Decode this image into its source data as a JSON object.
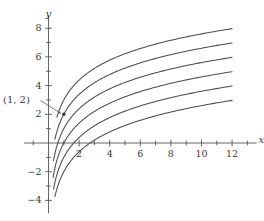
{
  "chart_data": {
    "type": "line",
    "title": "",
    "subtitle": "",
    "xlabel": "x",
    "ylabel": "y",
    "xlim": [
      -1.6,
      13.6
    ],
    "ylim": [
      -4.9,
      8.9
    ],
    "grid": false,
    "legend": null,
    "axis_color": "#55555a",
    "curve_color": "#4a4a52",
    "point_color": "#3a3a3a",
    "x_ticks_major": [
      2,
      4,
      6,
      8,
      10,
      12
    ],
    "x_ticks_all": [
      -1,
      1,
      2,
      3,
      4,
      5,
      6,
      7,
      8,
      9,
      10,
      11,
      12,
      13
    ],
    "x_tick_labels": [
      "2",
      "4",
      "6",
      "8",
      "10",
      "12"
    ],
    "y_ticks_major": [
      -4,
      -2,
      2,
      4,
      6,
      8
    ],
    "y_ticks_all": [
      -4,
      -3,
      -2,
      -1,
      1,
      2,
      3,
      4,
      5,
      6,
      7,
      8
    ],
    "y_tick_labels": [
      "8",
      "6",
      "4",
      "2",
      "-2",
      "-4"
    ],
    "annotations": [
      {
        "label": "(1, 2)",
        "x": 1,
        "y": 2,
        "marker": "dot",
        "leader_line": true
      }
    ],
    "series": [
      {
        "name": "y = 2 ln(x) + 3",
        "constant": 3,
        "scale": 2,
        "x": [
          0.55,
          0.7,
          0.9,
          1,
          1.25,
          1.5,
          2,
          2.5,
          3,
          4,
          5,
          6,
          7,
          8,
          9,
          10,
          11,
          12
        ],
        "values": [
          1.8,
          2.29,
          2.79,
          3.0,
          3.45,
          3.81,
          4.39,
          4.83,
          5.2,
          5.77,
          6.22,
          6.58,
          6.89,
          7.16,
          7.4,
          7.61,
          7.8,
          7.97
        ]
      },
      {
        "name": "y = 2 ln(x) + 2",
        "constant": 2,
        "scale": 2,
        "x": [
          0.42,
          0.55,
          0.7,
          0.9,
          1,
          1.25,
          1.5,
          2,
          2.5,
          3,
          4,
          5,
          6,
          7,
          8,
          9,
          10,
          11,
          12
        ],
        "values": [
          0.26,
          0.8,
          1.29,
          1.79,
          2.0,
          2.45,
          2.81,
          3.39,
          3.83,
          4.2,
          4.77,
          5.22,
          5.58,
          5.89,
          6.16,
          6.4,
          6.61,
          6.8,
          5.97
        ]
      },
      {
        "name": "y = 2 ln(x) + 1",
        "constant": 1,
        "scale": 2,
        "x": [
          0.33,
          0.45,
          0.6,
          0.8,
          1,
          1.25,
          1.5,
          2,
          2.5,
          3,
          4,
          5,
          6,
          7,
          8,
          9,
          10,
          11,
          12
        ],
        "values": [
          -1.22,
          -0.6,
          -0.02,
          0.55,
          1.0,
          1.45,
          1.81,
          2.39,
          2.83,
          3.2,
          3.77,
          4.22,
          4.58,
          4.89,
          5.16,
          5.4,
          5.61,
          5.8,
          5.97
        ]
      },
      {
        "name": "y = 2 ln(x)",
        "constant": 0,
        "scale": 2,
        "x": [
          0.3,
          0.45,
          0.6,
          0.8,
          1,
          1.25,
          1.5,
          2,
          2.5,
          3,
          4,
          5,
          6,
          7,
          8,
          9,
          10,
          11,
          12
        ],
        "values": [
          -2.41,
          -1.6,
          -1.02,
          -0.45,
          0.0,
          0.45,
          0.81,
          1.39,
          1.83,
          2.2,
          2.77,
          3.22,
          3.58,
          3.89,
          4.16,
          4.4,
          4.61,
          4.8,
          4.97
        ]
      },
      {
        "name": "y = 2 ln(x) - 1",
        "constant": -1,
        "scale": 2,
        "x": [
          0.33,
          0.45,
          0.6,
          0.8,
          1,
          1.25,
          1.5,
          2,
          2.5,
          3,
          4,
          5,
          6,
          7,
          8,
          9,
          10,
          11,
          12
        ],
        "values": [
          -3.22,
          -2.6,
          -2.02,
          -1.45,
          -1.0,
          -0.55,
          -0.19,
          0.39,
          0.83,
          1.2,
          1.77,
          2.22,
          2.58,
          2.89,
          3.16,
          3.4,
          3.61,
          3.8,
          3.97
        ]
      },
      {
        "name": "y = 2 ln(x) - 2",
        "constant": -2,
        "scale": 2,
        "x": [
          0.42,
          0.55,
          0.7,
          0.9,
          1,
          1.25,
          1.5,
          2,
          2.5,
          3,
          4,
          5,
          6,
          7,
          8,
          9,
          10,
          11,
          12
        ],
        "values": [
          -3.74,
          -3.2,
          -2.71,
          -2.21,
          -2.0,
          -1.55,
          -1.19,
          -0.61,
          -0.17,
          0.2,
          0.77,
          1.22,
          1.58,
          1.89,
          2.16,
          2.4,
          2.61,
          2.8,
          2.97
        ]
      }
    ]
  },
  "labels": {
    "x_axis_name": "x",
    "y_axis_name": "y",
    "x_2": "2",
    "x_4": "4",
    "x_6": "6",
    "x_8": "8",
    "x_10": "10",
    "x_12": "12",
    "y_8": "8",
    "y_6": "6",
    "y_4": "4",
    "y_2": "2",
    "y_neg2": "−2",
    "y_neg4": "−4",
    "point_label": "(1, 2)"
  }
}
